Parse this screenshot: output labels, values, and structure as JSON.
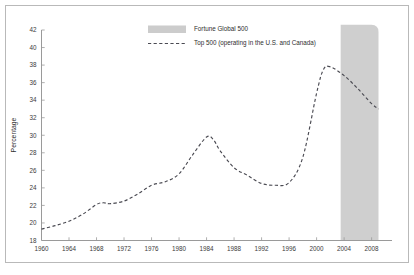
{
  "chart_data": {
    "type": "line",
    "title": "",
    "subtitle": "",
    "xlabel": "",
    "ylabel": "Percentage",
    "xlim": [
      1960,
      2009
    ],
    "ylim": [
      18,
      42
    ],
    "grid": false,
    "legend_position": "top-center",
    "xticks": [
      1960,
      1964,
      1968,
      1972,
      1976,
      1980,
      1984,
      1988,
      1992,
      1996,
      2000,
      2004,
      2008
    ],
    "yticks": [
      18,
      20,
      22,
      24,
      26,
      28,
      30,
      32,
      34,
      36,
      38,
      40,
      42
    ],
    "legend": [
      {
        "label": "Fortune Global 500",
        "marker": "band-swatch",
        "color": "#cccccc"
      },
      {
        "label": "Top 500 (operating in the U.S. and Canada)",
        "marker": "dashed-line",
        "color": "#4a4a52"
      }
    ],
    "annotations": [
      {
        "name": "fortune-global-500-band",
        "type": "shaded-region",
        "x_start": 2003.5,
        "x_end": 2009.0,
        "y_start": 18,
        "y_end": 42.6,
        "color": "#cfcfcf"
      }
    ],
    "series": [
      {
        "name": "Top 500 (operating in the U.S. and Canada)",
        "style": "dashed",
        "color": "#4a4a52",
        "x": [
          1960,
          1962,
          1964,
          1966,
          1968,
          1969,
          1970,
          1972,
          1974,
          1976,
          1978,
          1980,
          1982,
          1984,
          1985,
          1986,
          1988,
          1990,
          1992,
          1994,
          1996,
          1998,
          2000,
          2001,
          2002,
          2004,
          2006,
          2008,
          2009
        ],
        "values": [
          19.3,
          19.7,
          20.2,
          21.0,
          22.1,
          22.3,
          22.2,
          22.5,
          23.3,
          24.3,
          24.7,
          25.6,
          27.8,
          29.8,
          29.5,
          28.2,
          26.3,
          25.4,
          24.5,
          24.3,
          24.6,
          27.5,
          34.8,
          37.5,
          37.8,
          36.8,
          35.3,
          33.6,
          33.0
        ]
      }
    ]
  }
}
